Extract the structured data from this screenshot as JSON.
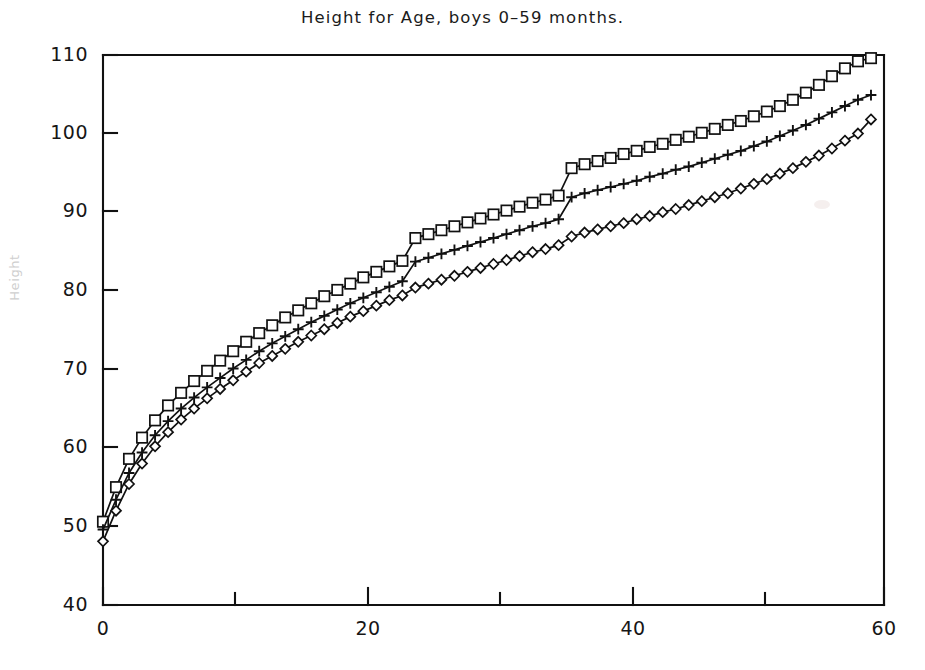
{
  "chart_data": {
    "type": "line",
    "title": "Height for Age, boys 0–59 months.",
    "xlabel": "",
    "ylabel": "Height",
    "xlim": [
      0,
      59
    ],
    "ylim": [
      40,
      110
    ],
    "grid": false,
    "legend": "none",
    "xticks": [
      0,
      20,
      40,
      60
    ],
    "xticklabels": [
      "0",
      "20",
      "40",
      "60"
    ],
    "xminorticks": [
      10,
      30,
      50
    ],
    "yticks": [
      40,
      50,
      60,
      70,
      80,
      90,
      100,
      110
    ],
    "yticklabels": [
      "40",
      "50",
      "60",
      "70",
      "80",
      "90",
      "100",
      "110"
    ],
    "x": [
      0,
      1,
      2,
      3,
      4,
      5,
      6,
      7,
      8,
      9,
      10,
      11,
      12,
      13,
      14,
      15,
      16,
      17,
      18,
      19,
      20,
      21,
      22,
      23,
      24,
      25,
      26,
      27,
      28,
      29,
      30,
      31,
      32,
      33,
      34,
      35,
      36,
      37,
      38,
      39,
      40,
      41,
      42,
      43,
      44,
      45,
      46,
      47,
      48,
      49,
      50,
      51,
      52,
      53,
      54,
      55,
      56,
      57,
      58,
      59
    ],
    "series": [
      {
        "name": "upper",
        "marker": "open-square",
        "values": [
          50.6,
          55.0,
          58.6,
          61.3,
          63.5,
          65.4,
          67.0,
          68.5,
          69.8,
          71.1,
          72.3,
          73.5,
          74.6,
          75.6,
          76.6,
          77.5,
          78.4,
          79.3,
          80.1,
          80.9,
          81.7,
          82.4,
          83.1,
          83.8,
          86.7,
          87.2,
          87.7,
          88.2,
          88.7,
          89.2,
          89.7,
          90.2,
          90.7,
          91.2,
          91.6,
          92.1,
          95.6,
          96.1,
          96.5,
          96.9,
          97.4,
          97.8,
          98.3,
          98.7,
          99.2,
          99.6,
          100.1,
          100.6,
          101.1,
          101.6,
          102.2,
          102.8,
          103.5,
          104.3,
          105.2,
          106.2,
          107.3,
          108.3,
          109.2,
          109.6
        ]
      },
      {
        "name": "median",
        "marker": "plus",
        "values": [
          49.6,
          53.4,
          56.8,
          59.4,
          61.6,
          63.4,
          65.0,
          66.4,
          67.7,
          68.9,
          70.1,
          71.2,
          72.3,
          73.3,
          74.2,
          75.1,
          76.0,
          76.8,
          77.6,
          78.4,
          79.1,
          79.8,
          80.5,
          81.2,
          83.7,
          84.2,
          84.7,
          85.2,
          85.7,
          86.2,
          86.7,
          87.2,
          87.7,
          88.2,
          88.6,
          89.1,
          91.9,
          92.4,
          92.8,
          93.2,
          93.6,
          94.0,
          94.5,
          94.9,
          95.4,
          95.8,
          96.3,
          96.8,
          97.3,
          97.8,
          98.4,
          99.0,
          99.7,
          100.4,
          101.1,
          101.9,
          102.7,
          103.5,
          104.3,
          104.9
        ]
      },
      {
        "name": "lower",
        "marker": "open-diamond",
        "values": [
          48.1,
          52.0,
          55.4,
          58.0,
          60.2,
          62.0,
          63.6,
          65.0,
          66.3,
          67.5,
          68.6,
          69.7,
          70.8,
          71.7,
          72.6,
          73.5,
          74.3,
          75.1,
          75.9,
          76.7,
          77.4,
          78.1,
          78.8,
          79.4,
          80.4,
          80.9,
          81.4,
          81.9,
          82.4,
          82.9,
          83.4,
          83.9,
          84.4,
          84.9,
          85.3,
          85.8,
          86.9,
          87.4,
          87.8,
          88.2,
          88.6,
          89.1,
          89.5,
          90.0,
          90.4,
          90.9,
          91.4,
          91.9,
          92.4,
          93.0,
          93.6,
          94.2,
          94.9,
          95.6,
          96.4,
          97.2,
          98.1,
          99.1,
          100.0,
          101.8
        ]
      }
    ]
  },
  "figure": {
    "title": "Height for Age, boys 0–59 months.",
    "y_axis_caption": "Height"
  }
}
